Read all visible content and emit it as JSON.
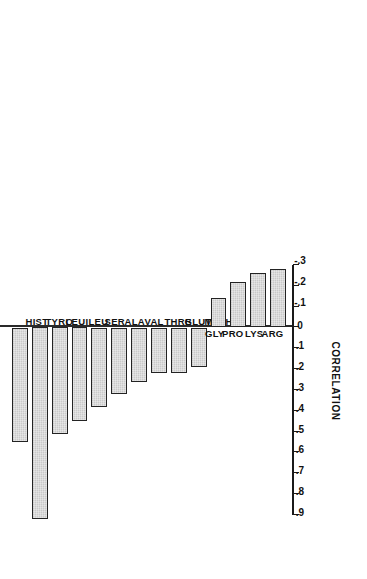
{
  "figure": {
    "orientation": "rotated-90-ccw",
    "background_color": "#ffffff",
    "bar_fill_color": "#c9c9c9",
    "bar_border_color": "#232323",
    "axis_color": "#1a1a1a"
  },
  "chart_data": {
    "type": "bar",
    "title": "",
    "subtitle": "",
    "xlabel": "",
    "ylabel": "CORRELATION",
    "orientation": "horizontal-rotated",
    "grid": false,
    "legend": null,
    "ylim": [
      -0.3,
      0.9
    ],
    "tick_labels": [
      ".9",
      ".8",
      ".7",
      ".6",
      ".5",
      ".4",
      ".3",
      ".2",
      ".1",
      "0",
      "-.1",
      "-.2",
      "-.3"
    ],
    "tick_values": [
      0.9,
      0.8,
      0.7,
      0.6,
      0.5,
      0.4,
      0.3,
      0.2,
      0.1,
      0.0,
      -0.1,
      -0.2,
      -0.3
    ],
    "categories": [
      "HIST",
      "TYRO",
      "LEU",
      "ILEU",
      "SER",
      "ALA",
      "VAL",
      "THRE",
      "GLUT",
      "METH",
      "GLY",
      "PRO",
      "LYS",
      "ARG"
    ],
    "values": [
      0.55,
      0.92,
      0.51,
      0.45,
      0.38,
      0.32,
      0.26,
      0.22,
      0.22,
      0.19,
      -0.14,
      -0.22,
      -0.26,
      -0.28
    ],
    "bars": [
      {
        "label": "HIST",
        "value": 0.55
      },
      {
        "label": "TYRO",
        "value": 0.92
      },
      {
        "label": "LEU",
        "value": 0.51
      },
      {
        "label": "ILEU",
        "value": 0.45
      },
      {
        "label": "SER",
        "value": 0.38
      },
      {
        "label": "ALA",
        "value": 0.32
      },
      {
        "label": "VAL",
        "value": 0.26
      },
      {
        "label": "THRE",
        "value": 0.22
      },
      {
        "label": "GLUT",
        "value": 0.22
      },
      {
        "label": "METH",
        "value": 0.19
      },
      {
        "label": "GLY",
        "value": -0.14
      },
      {
        "label": "PRO",
        "value": -0.22
      },
      {
        "label": "LYS",
        "value": -0.26
      },
      {
        "label": "ARG",
        "value": -0.28
      }
    ]
  }
}
